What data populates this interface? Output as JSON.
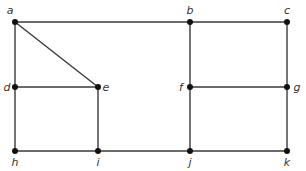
{
  "graph": {
    "nodes": [
      {
        "id": "a",
        "label": "a",
        "x": 15,
        "y": 22,
        "lx": 10,
        "ly": 14,
        "anchor": "middle"
      },
      {
        "id": "b",
        "label": "b",
        "x": 190,
        "y": 22,
        "lx": 190,
        "ly": 14,
        "anchor": "middle"
      },
      {
        "id": "c",
        "label": "c",
        "x": 287,
        "y": 22,
        "lx": 287,
        "ly": 14,
        "anchor": "middle"
      },
      {
        "id": "d",
        "label": "d",
        "x": 15,
        "y": 87,
        "lx": 7,
        "ly": 91,
        "anchor": "middle"
      },
      {
        "id": "e",
        "label": "e",
        "x": 98,
        "y": 87,
        "lx": 106,
        "ly": 91,
        "anchor": "middle"
      },
      {
        "id": "f",
        "label": "f",
        "x": 190,
        "y": 87,
        "lx": 181,
        "ly": 91,
        "anchor": "middle"
      },
      {
        "id": "g",
        "label": "g",
        "x": 287,
        "y": 87,
        "lx": 297,
        "ly": 91,
        "anchor": "middle"
      },
      {
        "id": "h",
        "label": "h",
        "x": 15,
        "y": 151,
        "lx": 15,
        "ly": 166,
        "anchor": "middle"
      },
      {
        "id": "i",
        "label": "i",
        "x": 98,
        "y": 151,
        "lx": 98,
        "ly": 166,
        "anchor": "middle"
      },
      {
        "id": "j",
        "label": "j",
        "x": 190,
        "y": 151,
        "lx": 190,
        "ly": 166,
        "anchor": "middle"
      },
      {
        "id": "k",
        "label": "k",
        "x": 287,
        "y": 151,
        "lx": 287,
        "ly": 166,
        "anchor": "middle"
      }
    ],
    "edges": [
      [
        "a",
        "b"
      ],
      [
        "b",
        "c"
      ],
      [
        "a",
        "d"
      ],
      [
        "a",
        "e"
      ],
      [
        "d",
        "e"
      ],
      [
        "b",
        "f"
      ],
      [
        "c",
        "g"
      ],
      [
        "f",
        "g"
      ],
      [
        "d",
        "h"
      ],
      [
        "e",
        "i"
      ],
      [
        "h",
        "i"
      ],
      [
        "i",
        "j"
      ],
      [
        "f",
        "j"
      ],
      [
        "g",
        "k"
      ],
      [
        "j",
        "k"
      ]
    ]
  }
}
